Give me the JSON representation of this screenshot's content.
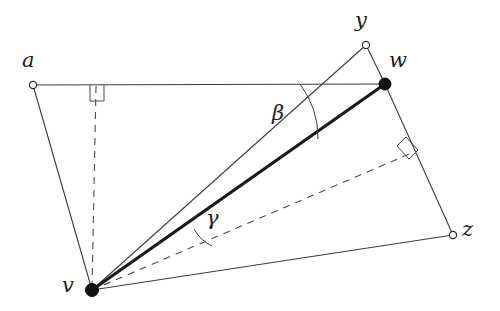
{
  "figure": {
    "width": 500,
    "height": 311,
    "background": "#ffffff",
    "stroke_color": "#3d3d3d",
    "thick_stroke_color": "#1a1a1a",
    "node_fill_color": "#111111",
    "node_open_color": "#ffffff"
  },
  "vertices": [
    {
      "id": "a",
      "label": "a",
      "x": 33,
      "y": 85,
      "marker": "open",
      "label_x": 22,
      "label_y": 50
    },
    {
      "id": "w",
      "label": "w",
      "x": 385,
      "y": 84,
      "marker": "filled",
      "label_x": 389,
      "label_y": 50
    },
    {
      "id": "y",
      "label": "y",
      "x": 366,
      "y": 45,
      "marker": "open",
      "label_x": 355,
      "label_y": 10
    },
    {
      "id": "z",
      "label": "z",
      "x": 453,
      "y": 235,
      "marker": "open",
      "label_x": 462,
      "label_y": 219
    },
    {
      "id": "v",
      "label": "v",
      "x": 92,
      "y": 290,
      "marker": "filled",
      "label_x": 62,
      "label_y": 275
    }
  ],
  "edges": [
    {
      "id": "a-w",
      "from": "a",
      "to": "w",
      "style": "thin",
      "x1": 33,
      "y1": 85,
      "x2": 385,
      "y2": 84
    },
    {
      "id": "a-v",
      "from": "a",
      "to": "v",
      "style": "thin",
      "x1": 33,
      "y1": 85,
      "x2": 92,
      "y2": 290
    },
    {
      "id": "v-z",
      "from": "v",
      "to": "z",
      "style": "thin",
      "x1": 92,
      "y1": 290,
      "x2": 453,
      "y2": 235
    },
    {
      "id": "w-z",
      "from": "w",
      "to": "z",
      "style": "thin",
      "x1": 385,
      "y1": 84,
      "x2": 453,
      "y2": 235
    },
    {
      "id": "y-w",
      "from": "y",
      "to": "w",
      "style": "thin",
      "x1": 366,
      "y1": 45,
      "x2": 385,
      "y2": 84
    },
    {
      "id": "v-y",
      "from": "v",
      "to": "y",
      "style": "thin",
      "x1": 92,
      "y1": 290,
      "x2": 366,
      "y2": 45
    },
    {
      "id": "v-w",
      "from": "v",
      "to": "w",
      "style": "thick",
      "x1": 92,
      "y1": 290,
      "x2": 385,
      "y2": 84
    }
  ],
  "dashed_edges": [
    {
      "id": "v-foot-aw",
      "label": "perpendicular from v to line a-w",
      "x1": 96,
      "y1": 86,
      "x2": 92,
      "y2": 290
    },
    {
      "id": "v-foot-wz",
      "label": "perpendicular from v to line w-z",
      "x1": 92,
      "y1": 290,
      "x2": 414,
      "y2": 152
    }
  ],
  "angle_marks": [
    {
      "id": "beta",
      "label": "β",
      "at_vertex": "w",
      "label_x": 272,
      "label_y": 103,
      "arc_path": "M 300 84 A 90 90 0 0 1 318 139",
      "description": "angle at w between segment w-a and segment w-v"
    },
    {
      "id": "gamma",
      "label": "γ",
      "at_vertex": "v",
      "label_x": 206,
      "label_y": 208,
      "arc_path": "M 196 231 A 130 130 0 0 1 211 245",
      "description": "angle at v between segment v-w and dashed perpendicular to w-z"
    }
  ],
  "right_angles": [
    {
      "id": "right-angle-aw",
      "points": "90,85 90,101 104,101 104,85",
      "description": "right angle where perpendicular from v meets line a-w"
    },
    {
      "id": "right-angle-wz",
      "points": "397,146 406,138 417,150 408,158",
      "description": "right angle where dashed segment from v meets line w-z"
    }
  ]
}
